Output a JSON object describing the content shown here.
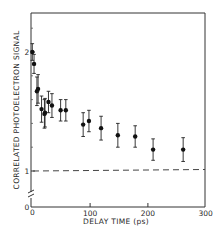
{
  "chart_data": {
    "type": "scatter",
    "title": "",
    "xlabel": "DELAY TIME (ps)",
    "ylabel": "CORRELATED PHOTOELECTRON SIGNAL",
    "xlim": [
      0,
      300
    ],
    "ylim_visible": [
      1,
      2.3
    ],
    "y_axis_break": true,
    "grid": false,
    "legend": null,
    "x_ticks": [
      0,
      100,
      200,
      300
    ],
    "x_tick_labels": [
      "0",
      "100",
      "200",
      "300"
    ],
    "y_ticks": [
      0,
      1,
      2
    ],
    "y_tick_labels": [
      "0",
      "1",
      "2"
    ],
    "reference_line": {
      "y": 1.0,
      "style": "dashed"
    },
    "series": [
      {
        "name": "data",
        "marker": "filled-circle",
        "error_bars": true,
        "x": [
          0,
          3,
          8,
          10,
          16,
          21,
          22,
          28,
          34,
          49,
          58,
          88,
          98,
          119,
          148,
          178,
          209,
          261
        ],
        "y": [
          2.0,
          1.9,
          1.67,
          1.69,
          1.52,
          1.48,
          1.49,
          1.58,
          1.55,
          1.51,
          1.51,
          1.39,
          1.42,
          1.36,
          1.3,
          1.29,
          1.18,
          1.18
        ],
        "y_err": [
          0.07,
          0.08,
          0.12,
          0.12,
          0.11,
          0.12,
          0.12,
          0.09,
          0.1,
          0.09,
          0.09,
          0.1,
          0.09,
          0.1,
          0.1,
          0.09,
          0.09,
          0.1
        ]
      }
    ]
  },
  "axes": {
    "xlabel": "DELAY TIME (ps)",
    "ylabel": "CORRELATED PHOTOELECTRON SIGNAL",
    "x_origin_label": "0",
    "y_origin_label": "0"
  }
}
